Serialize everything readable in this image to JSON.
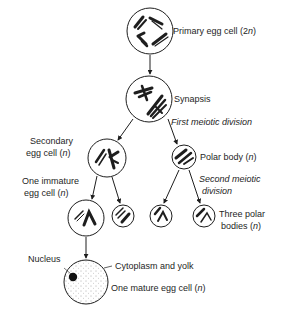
{
  "labels": {
    "primary": "Primary egg cell (2",
    "primary_n": "n",
    "primary_close": ")",
    "synapsis": "Synapsis",
    "first_division": "First meiotic division",
    "secondary_line1": "Secondary",
    "secondary_line2": "egg cell (",
    "secondary_n": "n",
    "secondary_close": ")",
    "polar_body": "Polar body (",
    "polar_n": "n",
    "polar_close": ")",
    "second_division_line1": "Second meiotic",
    "second_division_line2": "division",
    "immature_line1": "One immature",
    "immature_line2": "egg cell (",
    "immature_n": "n",
    "immature_close": ")",
    "three_polar_line1": "Three polar",
    "three_polar_line2": "bodies (",
    "three_polar_n": "n",
    "three_polar_close": ")",
    "nucleus": "Nucleus",
    "cytoplasm": "Cytoplasm and yolk",
    "mature": "One mature egg cell (",
    "mature_n": "n",
    "mature_close": ")"
  },
  "colors": {
    "line": "#1e1e1e",
    "background": "#ffffff"
  }
}
